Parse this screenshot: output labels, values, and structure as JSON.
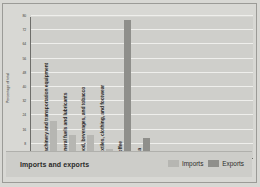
{
  "chart_data": {
    "type": "bar",
    "title": "Imports and exports",
    "xlabel": "",
    "ylabel": "Percentage of total",
    "ylim": [
      0,
      80
    ],
    "yticks": [
      0,
      8,
      16,
      24,
      32,
      40,
      48,
      56,
      64,
      72,
      80
    ],
    "grid": true,
    "legend_position": "bottom-right",
    "categories": [
      "Machinery and transportation equipment",
      "Mineral fuels and lubricants",
      "Food, beverages, and tobacco",
      "Textiles, clothing, and footwear",
      "Coffee",
      "Tea"
    ],
    "series": [
      {
        "name": "Imports",
        "color": "#b6b6b2",
        "values": [
          21,
          13,
          13,
          5,
          null,
          null
        ]
      },
      {
        "name": "Exports",
        "color": "#8f8f8b",
        "values": [
          null,
          null,
          null,
          null,
          78,
          11
        ]
      }
    ],
    "bars": [
      {
        "category": "Machinery and transportation equipment",
        "series": "Imports",
        "value": 21
      },
      {
        "category": "Mineral fuels and lubricants",
        "series": "Imports",
        "value": 13
      },
      {
        "category": "Food, beverages, and tobacco",
        "series": "Imports",
        "value": 13
      },
      {
        "category": "Textiles, clothing, and footwear",
        "series": "Imports",
        "value": 5
      },
      {
        "category": "Coffee",
        "series": "Exports",
        "value": 78
      },
      {
        "category": "Tea",
        "series": "Exports",
        "value": 11
      }
    ]
  },
  "legend": {
    "imports_label": "Imports",
    "exports_label": "Exports"
  },
  "colors": {
    "imports": "#b6b6b2",
    "exports": "#8f8f8b",
    "plot_background": "#cfcfcb",
    "figure_background": "#d8d8d4",
    "gridline": "#efefec",
    "axis": "#6e6e6a"
  }
}
